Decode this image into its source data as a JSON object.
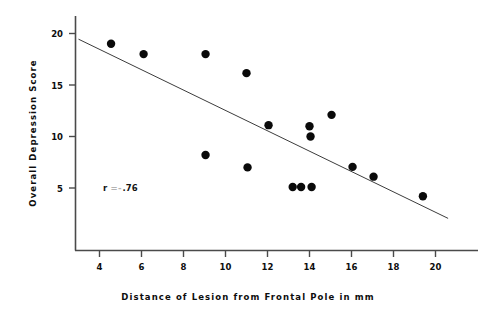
{
  "chart_data": {
    "type": "scatter",
    "title": "",
    "xlabel": "Distance of Lesion from Frontal Pole in mm",
    "ylabel": "Overall Depression Score",
    "xlim": [
      3.0,
      21.2
    ],
    "ylim": [
      0.0,
      21.2
    ],
    "xticks": [
      4,
      6,
      8,
      10,
      12,
      14,
      16,
      18,
      20
    ],
    "xtick_labels": [
      "4",
      "6",
      "8",
      "10",
      "12",
      "14",
      "16",
      "18",
      "20"
    ],
    "yticks": [
      5,
      10,
      15,
      20
    ],
    "ytick_labels": [
      "5",
      "10",
      "15",
      "20"
    ],
    "grid": false,
    "legend": null,
    "points": [
      {
        "x": 4.55,
        "y": 19.0
      },
      {
        "x": 6.1,
        "y": 18.0
      },
      {
        "x": 9.05,
        "y": 18.0
      },
      {
        "x": 11.0,
        "y": 16.15
      },
      {
        "x": 9.05,
        "y": 8.2
      },
      {
        "x": 11.05,
        "y": 7.0
      },
      {
        "x": 12.05,
        "y": 11.1
      },
      {
        "x": 14.0,
        "y": 11.0
      },
      {
        "x": 14.05,
        "y": 10.0
      },
      {
        "x": 15.05,
        "y": 12.1
      },
      {
        "x": 13.2,
        "y": 5.1
      },
      {
        "x": 13.6,
        "y": 5.1
      },
      {
        "x": 14.1,
        "y": 5.1
      },
      {
        "x": 16.05,
        "y": 7.05
      },
      {
        "x": 17.05,
        "y": 6.1
      },
      {
        "x": 19.4,
        "y": 4.2
      }
    ],
    "marker": {
      "shape": "circle",
      "size": 4.2,
      "color": "#0a0a0a"
    },
    "fit_line": {
      "x_start": 3.0,
      "y_start": 19.45,
      "x_end": 20.6,
      "y_end": 2.05,
      "color": "#3c3c3c",
      "width": 1.0
    },
    "annotations": [
      {
        "id": "correlation",
        "text_prefix": "r",
        "text_equals": "=",
        "text_minus": "-",
        "text_value": ".76",
        "x": 5.1,
        "y": 5.35
      }
    ],
    "axis_color": "#4a4a4a"
  }
}
